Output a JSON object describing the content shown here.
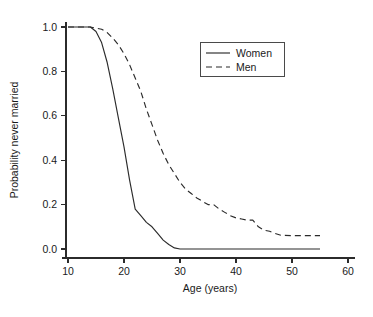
{
  "chart_data": {
    "type": "line",
    "title": "",
    "xlabel": "Age (years)",
    "ylabel": "Probability never married",
    "xlim": [
      10,
      60
    ],
    "ylim": [
      0.0,
      1.0
    ],
    "grid": false,
    "legend_position": "upper right",
    "x_ticks": [
      "10",
      "20",
      "30",
      "40",
      "50",
      "60"
    ],
    "x_tick_values": [
      10,
      20,
      30,
      40,
      50,
      60
    ],
    "y_ticks": [
      "0.0",
      "0.2",
      "0.4",
      "0.6",
      "0.8",
      "1.0"
    ],
    "y_tick_values": [
      0.0,
      0.2,
      0.4,
      0.6,
      0.8,
      1.0
    ],
    "series": [
      {
        "name": "Women",
        "style": "solid",
        "color": "#2b2b2b",
        "x": [
          10,
          12,
          13,
          14,
          15,
          16,
          17,
          18,
          19,
          20,
          21,
          22,
          23,
          24,
          25,
          26,
          27,
          28,
          29,
          30,
          35,
          40,
          45,
          50,
          55
        ],
        "values": [
          1.0,
          1.0,
          1.0,
          1.0,
          0.98,
          0.93,
          0.84,
          0.72,
          0.59,
          0.46,
          0.31,
          0.18,
          0.15,
          0.12,
          0.1,
          0.07,
          0.04,
          0.02,
          0.005,
          0.0,
          0.0,
          0.0,
          0.0,
          0.0,
          0.0
        ]
      },
      {
        "name": "Men",
        "style": "dashed",
        "color": "#2b2b2b",
        "x": [
          10,
          12,
          14,
          15,
          16,
          17,
          18,
          19,
          20,
          21,
          22,
          23,
          24,
          25,
          26,
          27,
          28,
          29,
          30,
          31,
          32,
          33,
          34,
          35,
          36,
          37,
          38,
          39,
          40,
          41,
          42,
          43,
          44,
          45,
          46,
          47,
          48,
          50,
          52,
          55
        ],
        "values": [
          1.0,
          1.0,
          1.0,
          0.995,
          0.99,
          0.975,
          0.95,
          0.92,
          0.88,
          0.83,
          0.77,
          0.71,
          0.63,
          0.56,
          0.49,
          0.43,
          0.38,
          0.34,
          0.3,
          0.27,
          0.25,
          0.23,
          0.215,
          0.2,
          0.2,
          0.18,
          0.165,
          0.15,
          0.14,
          0.135,
          0.13,
          0.13,
          0.1,
          0.085,
          0.08,
          0.07,
          0.062,
          0.06,
          0.06,
          0.06
        ]
      }
    ],
    "legend": [
      {
        "label": "Women",
        "style": "solid"
      },
      {
        "label": "Men",
        "style": "dashed"
      }
    ]
  },
  "geometry": {
    "x_pixel_at_10": 68,
    "x_pixel_at_60": 348,
    "y_pixel_at_0": 249,
    "y_pixel_at_1": 27,
    "axis_left_x": 66,
    "axis_bottom_y": 258,
    "legend_box": {
      "x": 200,
      "y": 42,
      "w": 84,
      "h": 34
    }
  }
}
